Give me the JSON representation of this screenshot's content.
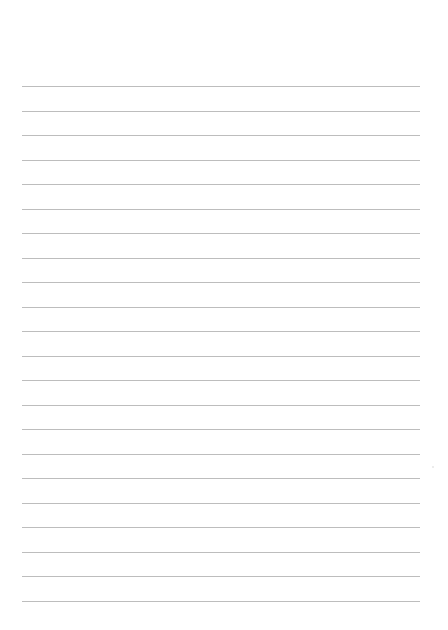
{
  "page": {
    "type": "lined-paper",
    "background_color": "#ffffff",
    "line_color": "#bdbdbd",
    "line_count": 22,
    "first_line_y": 86,
    "line_spacing": 24.5,
    "line_left": 22,
    "line_right": 420
  }
}
